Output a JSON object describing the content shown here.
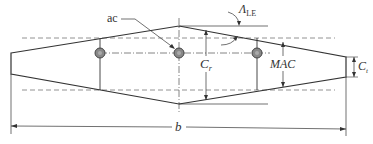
{
  "diagram": {
    "labels": {
      "ac": "ac",
      "sweep": "Λ",
      "sweep_sub": "LE",
      "root_chord": "C",
      "root_chord_sub": "r",
      "tip_chord": "C",
      "tip_chord_sub": "t",
      "mac": "MAC",
      "span": "b"
    },
    "colors": {
      "outline": "#333333",
      "dashed": "#777777",
      "ac_fill": "#888888",
      "ac_ring": "#444444"
    }
  }
}
